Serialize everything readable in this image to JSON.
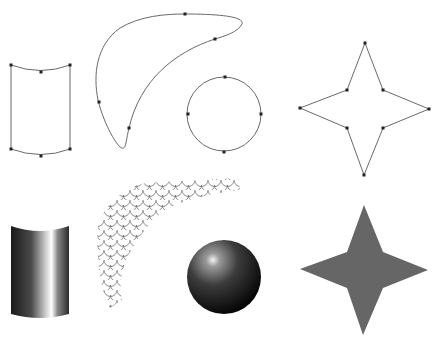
{
  "diagram": {
    "colors": {
      "stroke": "#6a6a6a",
      "handle": "#222222",
      "star_fill": "#666666",
      "background": "#ffffff"
    },
    "top_row": [
      {
        "name": "cylinder-outline",
        "anchors": [
          [
            11,
            65
          ],
          [
            41,
            72
          ],
          [
            70,
            65
          ],
          [
            11,
            149
          ],
          [
            41,
            156
          ],
          [
            70,
            149
          ]
        ]
      },
      {
        "name": "crescent-outline",
        "anchors": [
          [
            185,
            14
          ],
          [
            215,
            39
          ],
          [
            99,
            102
          ],
          [
            129,
            128
          ]
        ]
      },
      {
        "name": "circle-outline",
        "center": [
          224,
          114
        ],
        "radius": 37,
        "anchors": [
          [
            225,
            77
          ],
          [
            188,
            114
          ],
          [
            261,
            114
          ],
          [
            224,
            152
          ]
        ]
      },
      {
        "name": "star-outline",
        "anchors": [
          [
            365,
            43
          ],
          [
            383,
            90
          ],
          [
            429,
            109
          ],
          [
            383,
            128
          ],
          [
            364,
            175
          ],
          [
            347,
            128
          ],
          [
            300,
            108
          ],
          [
            347,
            90
          ]
        ]
      }
    ],
    "bottom_row": [
      {
        "name": "shaded-cylinder"
      },
      {
        "name": "fish-scale-pattern"
      },
      {
        "name": "shaded-sphere",
        "center": [
          224,
          277
        ],
        "radius": 37
      },
      {
        "name": "filled-star",
        "points": [
          [
            364,
            205
          ],
          [
            383,
            252
          ],
          [
            428,
            270
          ],
          [
            383,
            288
          ],
          [
            363,
            335
          ],
          [
            347,
            288
          ],
          [
            300,
            269
          ],
          [
            347,
            252
          ]
        ]
      }
    ]
  }
}
